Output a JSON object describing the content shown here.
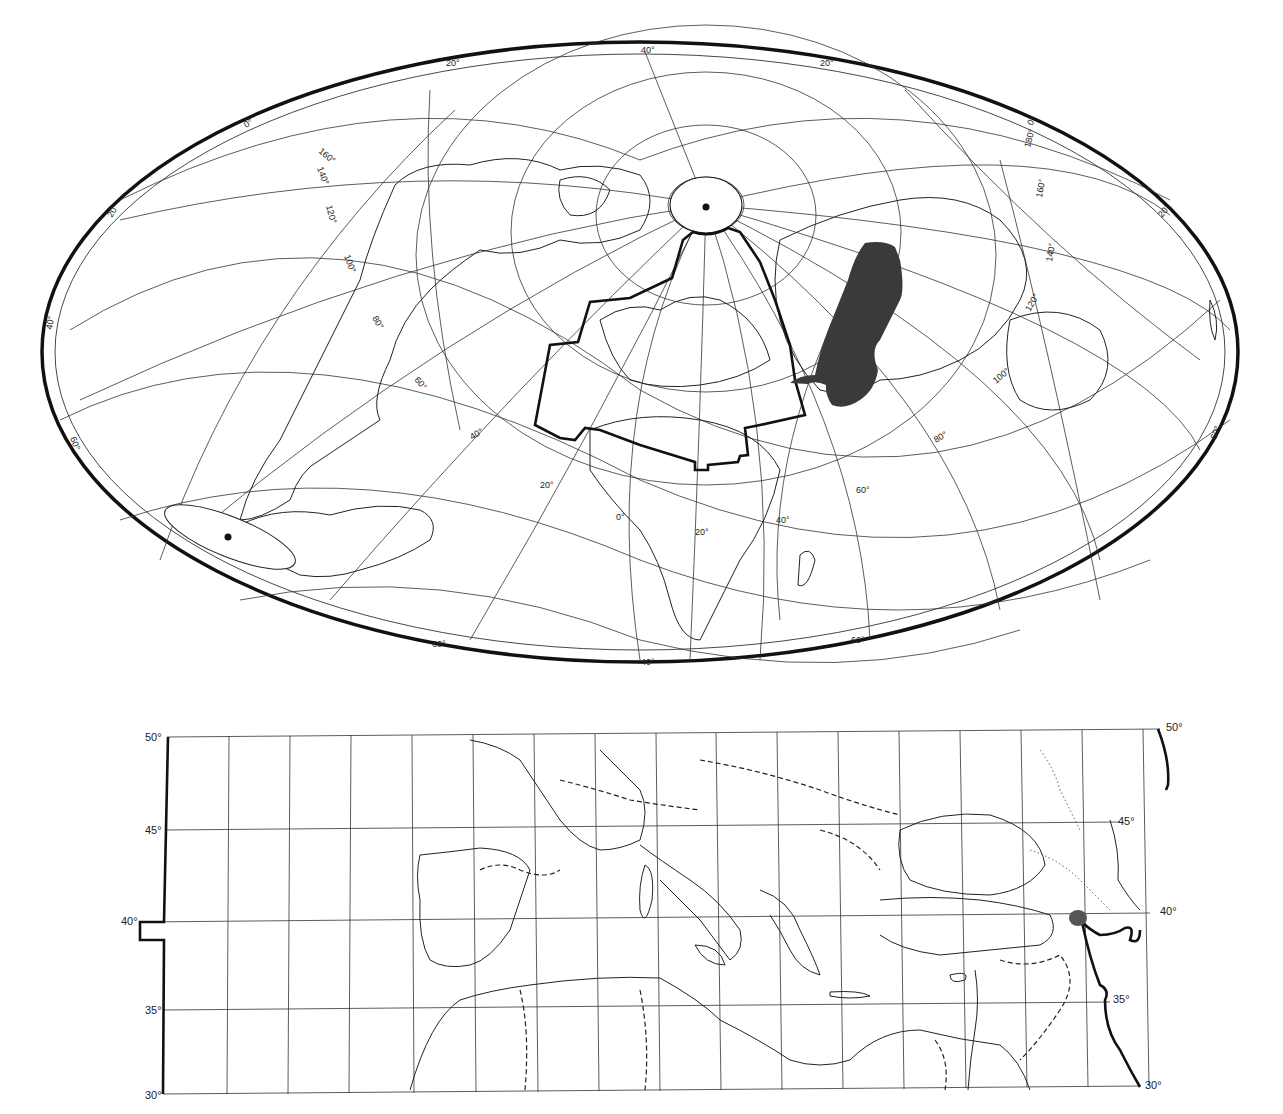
{
  "figure": {
    "upper_map": {
      "projection": "oblique-aitoff-world",
      "pole_marker": "north-pole-dot",
      "antipode_marker": "south-pole-dot",
      "outlined_region": "Europe-Mediterranean-Middle East study area",
      "shaded_region": "Central Asia distribution (dark fill)",
      "shade_color": "#3a3a3a",
      "labels": {
        "top_40": "40°",
        "top_left_20": "20°",
        "top_right_20": "20°",
        "left_0": "0°",
        "left_160": "160°",
        "left_140": "140°",
        "left_120": "120°",
        "left_100": "100°",
        "left_80": "80°",
        "left_60": "60°",
        "left_40": "40°",
        "edge_20_left": "20°",
        "edge_40_left": "40°",
        "edge_60_left": "60°",
        "mid_40": "40°",
        "mid_20": "20°",
        "mid_0": "0°",
        "mid_20b": "20°",
        "mid_40b": "40°",
        "mid_60": "60°",
        "mid_80": "80°",
        "mid_100": "100°",
        "mid_120": "120°",
        "mid_140": "140°",
        "mid_160": "160°",
        "mid_180": "180°",
        "right_0": "0°",
        "right_20": "20°",
        "right_60": "60°",
        "bottom_60_left": "60°",
        "bottom_40": "40°",
        "bottom_60_right": "60°"
      }
    },
    "lower_map": {
      "projection": "equirectangular-detail",
      "lat_range": [
        30,
        50
      ],
      "lat_labels_left": [
        "50°",
        "45°",
        "40°",
        "35°",
        "30°"
      ],
      "lat_labels_right": [
        "50°",
        "45°",
        "40°",
        "35°",
        "30°"
      ],
      "meridian_count": 16,
      "shaded_spot": "small shaded area near 40°N on eastern boundary",
      "shade_color": "#555555"
    }
  }
}
